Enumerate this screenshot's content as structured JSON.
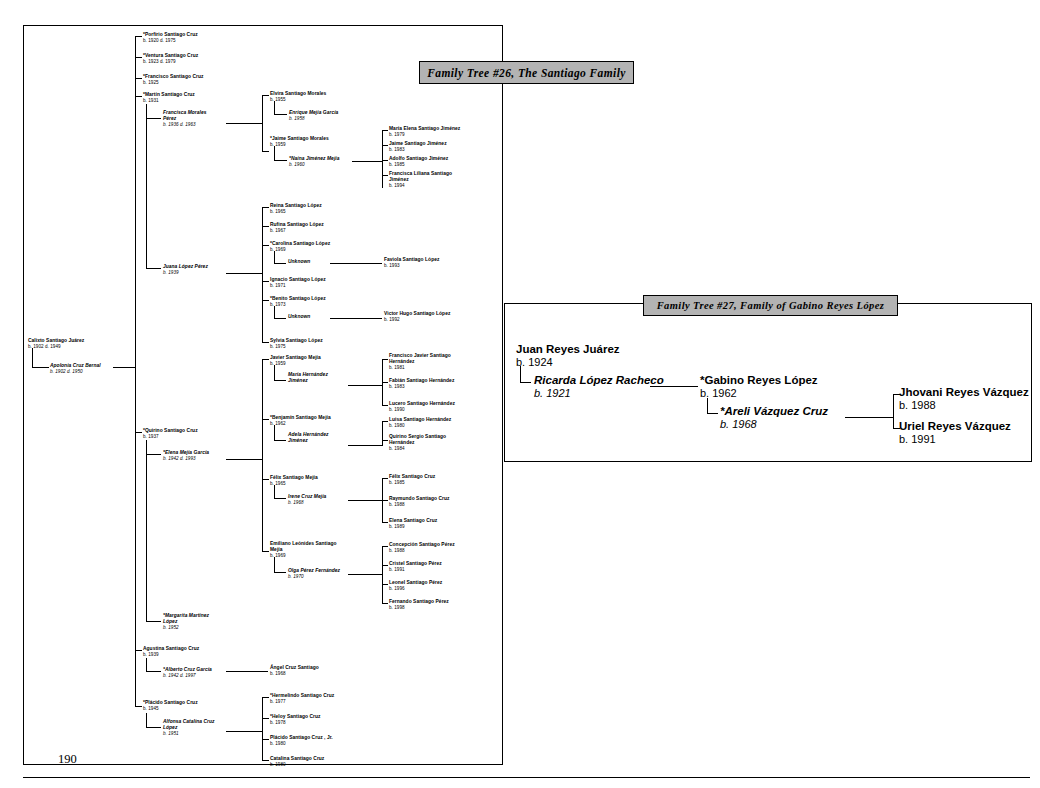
{
  "main_tree": {
    "title": "Family Tree #26, The Santiago Family",
    "page_number": "190",
    "root": {
      "name": "Calixto Santiago Juárez",
      "dates": "b. 1902 d. 1949"
    },
    "root_spouse": {
      "name": "Apolonia Cruz Bernal",
      "dates": "b. 1902 d. 1950"
    },
    "children": [
      {
        "name": "*Porfirio Santiago Cruz",
        "dates": "b. 1920 d. 1975"
      },
      {
        "name": "*Ventura Santiago Cruz",
        "dates": "b. 1923 d. 1979"
      },
      {
        "name": "*Francisco Santiago Cruz",
        "dates": "b. 1925"
      },
      {
        "name": "*Martín Santiago Cruz",
        "dates": "b. 1931"
      },
      {
        "name": "*Quirino Santiago Cruz",
        "dates": "b. 1937"
      },
      {
        "name": "Agustina Santiago Cruz",
        "dates": "b. 1939"
      },
      {
        "name": "*Plácido Santiago Cruz",
        "dates": "b. 1945"
      }
    ],
    "spouses": {
      "martin": {
        "name": "Francisca Morales\nPérez",
        "dates": "b. 1936 d. 1963"
      },
      "martin2": {
        "name": "Juana López Pérez",
        "dates": "b. 1939"
      },
      "quirino": {
        "name": "*Elena Mejía García",
        "dates": "b. 1942 d. 1993"
      },
      "quirino2": {
        "name": "*Margarita Martínez\nLópez",
        "dates": "b. 1952"
      },
      "agustina": {
        "name": "*Alberto Cruz García",
        "dates": "b. 1942 d. 1997"
      },
      "placido": {
        "name": "Alfonsa Catalina Cruz\nLópez",
        "dates": "b. 1951"
      }
    },
    "martin_francisca_children": [
      {
        "name": "Elvira Santiago Morales",
        "dates": "b. 1955",
        "spouse": {
          "name": "Enrique Mejía García",
          "dates": "b. 1958"
        },
        "kids": []
      },
      {
        "name": "*Jaime Santiago Morales",
        "dates": "b. 1959",
        "spouse": {
          "name": "*Naína Jiménez Mejía",
          "dates": "b. 1960"
        },
        "kids": [
          {
            "name": "María Elena Santiago Jiménez",
            "dates": "b. 1979"
          },
          {
            "name": "Jaime Santiago Jiménez",
            "dates": "b. 1983"
          },
          {
            "name": "Adolfo Santiago Jiménez",
            "dates": "b. 1985"
          },
          {
            "name": "Francisca Liliana Santiago\nJiménez",
            "dates": "b. 1994"
          }
        ]
      }
    ],
    "martin_juana_children": [
      {
        "name": "Reina Santiago López",
        "dates": "b. 1965",
        "spouse": null,
        "kids": []
      },
      {
        "name": "Rufina Santiago López",
        "dates": "b. 1967",
        "spouse": null,
        "kids": []
      },
      {
        "name": "*Carolina Santiago López",
        "dates": "b. 1969",
        "spouse": {
          "name": "Unknown",
          "dates": ""
        },
        "kids": [
          {
            "name": "Faviola Santiago López",
            "dates": "b. 1993"
          }
        ]
      },
      {
        "name": "Ignacio Santiago López",
        "dates": "b. 1971",
        "spouse": null,
        "kids": []
      },
      {
        "name": "*Benito Santiago López",
        "dates": "b. 1973",
        "spouse": {
          "name": "Unknown",
          "dates": ""
        },
        "kids": [
          {
            "name": "Victor Hugo Santiago López",
            "dates": "b. 1992"
          }
        ]
      },
      {
        "name": "Sylvia Santiago López",
        "dates": "b. 1975",
        "spouse": null,
        "kids": []
      }
    ],
    "quirino_elena_children": [
      {
        "name": "Javier Santiago Mejía",
        "dates": "b. 1959",
        "spouse": {
          "name": "María Hernández\nJiménez",
          "dates": ""
        },
        "kids": [
          {
            "name": "Francisco Javier Santiago\nHernández",
            "dates": "b. 1981"
          },
          {
            "name": "Fabián Santiago Hernández",
            "dates": "b. 1983"
          },
          {
            "name": "Lucero Santiago Hernández",
            "dates": "b. 1990"
          }
        ]
      },
      {
        "name": "*Benjamín Santiago Mejía",
        "dates": "b. 1962",
        "spouse": {
          "name": "Adela Hernández\nJiménez",
          "dates": ""
        },
        "kids": [
          {
            "name": "Luisa Santiago Hernández",
            "dates": "b. 1980"
          },
          {
            "name": "Quirino Sergio Santiago\nHernández",
            "dates": "b. 1984"
          }
        ]
      },
      {
        "name": "Félix Santiago Mejía",
        "dates": "b. 1965",
        "spouse": {
          "name": "Irene Cruz Mejía",
          "dates": "b. 1968"
        },
        "kids": [
          {
            "name": "Félix Santiago Cruz",
            "dates": "b. 1985"
          },
          {
            "name": "Raymundo Santiago Cruz",
            "dates": "b. 1988"
          },
          {
            "name": "Elena Santiago Cruz",
            "dates": "b. 1989"
          }
        ]
      },
      {
        "name": "Emiliano Leónides Santiago\nMejía",
        "dates": "b. 1969",
        "spouse": {
          "name": "Olga Pérez Fernández",
          "dates": "b. 1970"
        },
        "kids": [
          {
            "name": "Concepción Santiago Pérez",
            "dates": "b. 1988"
          },
          {
            "name": "Cristel Santiago Pérez",
            "dates": "b. 1991"
          },
          {
            "name": "Leonel Santiago Pérez",
            "dates": "b. 1996"
          },
          {
            "name": "Fernando Santiago Pérez",
            "dates": "b. 1998"
          }
        ]
      }
    ],
    "agustina_children": [
      {
        "name": "Ángel Cruz Santiago",
        "dates": "b. 1968"
      }
    ],
    "placido_children": [
      {
        "name": "*Hermelindo Santiago Cruz",
        "dates": "b. 1977"
      },
      {
        "name": "*Heloy Santiago Cruz",
        "dates": "b. 1978"
      },
      {
        "name": "Plácido Santiago Cruz , Jr.",
        "dates": "b. 1980"
      },
      {
        "name": "Catalina Santiago Cruz",
        "dates": "b. 1980"
      }
    ]
  },
  "side_tree": {
    "title": "Family Tree #27, Family of Gabino Reyes López",
    "root": {
      "name": "Juan Reyes Juárez",
      "dates": "b. 1924"
    },
    "root_spouse": {
      "name": "Ricarda López Racheco",
      "dates": "b. 1921"
    },
    "child": {
      "name": "*Gabino Reyes López",
      "dates": "b. 1962"
    },
    "child_spouse": {
      "name": "*Areli Vázquez Cruz",
      "dates": "b. 1968"
    },
    "grandchildren": [
      {
        "name": "Jhovani Reyes Vázquez",
        "dates": "b. 1988"
      },
      {
        "name": "Uriel Reyes Vázquez",
        "dates": "b. 1991"
      }
    ]
  }
}
